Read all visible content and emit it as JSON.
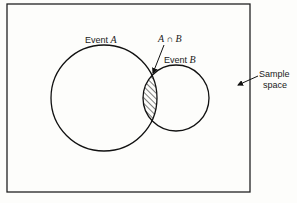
{
  "diagram": {
    "type": "venn",
    "labels": {
      "event_a_prefix": "Event ",
      "event_a_var": "A",
      "event_b_prefix": "Event ",
      "event_b_var": "B",
      "intersection_a": "A",
      "intersection_op": " ∩ ",
      "intersection_b": "B",
      "sample_line1": "Sample",
      "sample_line2": "space"
    },
    "shapes": {
      "circle_a": {
        "cx": 104,
        "cy": 98,
        "r": 53
      },
      "circle_b": {
        "cx": 176,
        "cy": 98,
        "r": 33
      },
      "sample_space_rect": {
        "x": 7,
        "y": 4,
        "w": 243,
        "h": 188
      }
    },
    "shaded_region": "A ∩ B",
    "colors": {
      "stroke": "#111111",
      "background": "#fdfdfb"
    }
  }
}
